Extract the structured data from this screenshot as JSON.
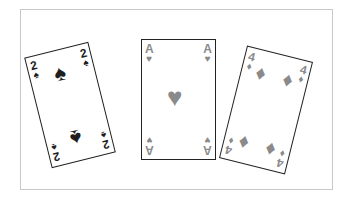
{
  "cards": [
    {
      "rank": "2",
      "suit": "spades",
      "suit_glyph": "♠",
      "color": "#1e1e1e"
    },
    {
      "rank": "A",
      "suit": "hearts",
      "suit_glyph": "♥",
      "color": "#8a8a8a"
    },
    {
      "rank": "4",
      "suit": "diamonds",
      "suit_glyph": "♦",
      "color": "#8a8a8a"
    }
  ],
  "frame_color": "#c8c8c8"
}
